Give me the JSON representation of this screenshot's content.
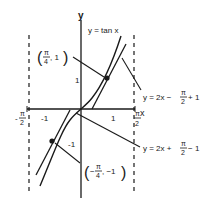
{
  "diagram": {
    "axes": {
      "x_label": "x",
      "y_label": "y",
      "x_ticks": [
        "-1",
        "1"
      ],
      "y_ticks": [
        "1",
        "-1"
      ],
      "asymptote_left": {
        "num": "π",
        "den": "2",
        "sign": "-"
      },
      "asymptote_right": {
        "num": "π",
        "den": "2",
        "sign": ""
      }
    },
    "curve_label": "y = tan x",
    "tangent_upper": {
      "prefix": "y = 2x − ",
      "frac_num": "π",
      "frac_den": "2",
      "suffix": "+ 1"
    },
    "tangent_lower": {
      "prefix": "y = 2x + ",
      "frac_num": "π",
      "frac_den": "2",
      "suffix": "− 1"
    },
    "point_upper": {
      "open": "(",
      "frac_num": "π",
      "frac_den": "4",
      "rest": ", 1",
      "close": ")"
    },
    "point_lower": {
      "open": "(",
      "sign": "−",
      "frac_num": "π",
      "frac_den": "4",
      "rest": ", −1",
      "close": ")"
    },
    "colors": {
      "ink": "#1a1a1a",
      "background": "#ffffff"
    }
  }
}
